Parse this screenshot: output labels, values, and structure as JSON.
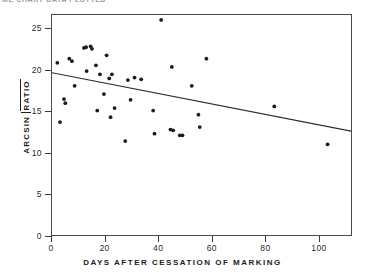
{
  "header": {
    "cropped_title": "ME CHART DATA PLOTTED"
  },
  "axes": {
    "xlabel": "DAYS AFTER CESSATION OF MARKING",
    "ylabel_prefix": "ARCSIN",
    "ylabel_radical": "RATIO",
    "xticks": [
      "0",
      "20",
      "40",
      "60",
      "80",
      "100"
    ],
    "yticks": [
      "0",
      "5",
      "10",
      "15",
      "20",
      "25"
    ]
  },
  "chart_data": {
    "type": "scatter",
    "title": "",
    "xlabel": "DAYS AFTER CESSATION OF MARKING",
    "ylabel": "ARCSIN √RATIO",
    "xlim": [
      0,
      112.3
    ],
    "ylim": [
      0,
      26.7
    ],
    "xticks": [
      0,
      20,
      40,
      60,
      80,
      100
    ],
    "yticks": [
      0,
      5,
      10,
      15,
      20,
      25
    ],
    "grid": false,
    "legend": null,
    "points": [
      [
        2.0,
        20.9
      ],
      [
        3.0,
        13.7
      ],
      [
        4.5,
        16.5
      ],
      [
        5.0,
        16.0
      ],
      [
        6.5,
        21.4
      ],
      [
        7.5,
        21.1
      ],
      [
        8.5,
        18.1
      ],
      [
        12.0,
        22.7
      ],
      [
        12.8,
        22.8
      ],
      [
        13.0,
        19.9
      ],
      [
        14.5,
        22.9
      ],
      [
        15.0,
        22.6
      ],
      [
        16.5,
        20.6
      ],
      [
        17.0,
        15.1
      ],
      [
        18.0,
        19.5
      ],
      [
        19.5,
        17.1
      ],
      [
        20.5,
        21.8
      ],
      [
        21.5,
        19.0
      ],
      [
        22.0,
        14.3
      ],
      [
        22.5,
        19.5
      ],
      [
        23.5,
        15.4
      ],
      [
        27.5,
        11.4
      ],
      [
        28.5,
        18.8
      ],
      [
        29.5,
        16.4
      ],
      [
        31.0,
        19.1
      ],
      [
        33.5,
        18.9
      ],
      [
        38.0,
        15.1
      ],
      [
        38.5,
        12.3
      ],
      [
        41.0,
        26.1
      ],
      [
        44.5,
        12.8
      ],
      [
        45.0,
        20.4
      ],
      [
        45.5,
        12.7
      ],
      [
        48.0,
        12.1
      ],
      [
        49.0,
        12.1
      ],
      [
        52.5,
        18.1
      ],
      [
        55.0,
        14.6
      ],
      [
        55.5,
        13.1
      ],
      [
        58.0,
        21.4
      ],
      [
        83.5,
        15.6
      ],
      [
        103.5,
        11.0
      ]
    ],
    "trendline": {
      "type": "linear",
      "x": [
        0,
        112.3
      ],
      "y": [
        19.7,
        12.6
      ],
      "slope": -0.0632,
      "intercept": 19.7
    }
  },
  "style": {
    "point_color": "#1b1b1b",
    "line_color": "#2a2a2a",
    "frame_color": "#4a4a4a",
    "background": "#ffffff"
  }
}
